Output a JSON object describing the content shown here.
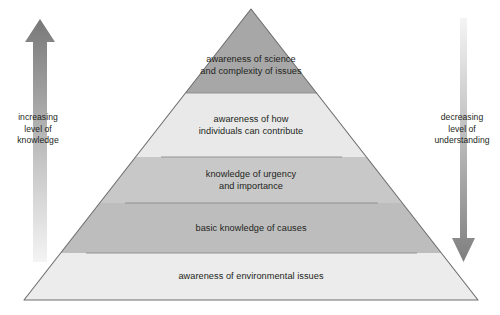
{
  "diagram": {
    "type": "pyramid",
    "title": "",
    "levels": [
      {
        "id": "level-5-top",
        "label": "awareness of science\nand complexity of issues",
        "fill": "#a7a7a7",
        "rank": 5
      },
      {
        "id": "level-4",
        "label": "awareness of how\nindividuals can contribute",
        "fill": "#e9e9e9",
        "rank": 4
      },
      {
        "id": "level-3",
        "label": "knowledge of urgency\nand importance",
        "fill": "#c8c8c8",
        "rank": 3
      },
      {
        "id": "level-2",
        "label": "basic knowledge of causes",
        "fill": "#bdbdbd",
        "rank": 2
      },
      {
        "id": "level-1-base",
        "label": "awareness of environmental issues",
        "fill": "#ececec",
        "rank": 1
      }
    ],
    "outline_color": "#6e6e6e",
    "divider_color": "#8c8c8c"
  },
  "left_axis": {
    "name": "increasing-level-of-knowledge",
    "label": "increasing\nlevel of\nknowledge",
    "direction": "up",
    "arrow_color_dark": "#7d7d7d",
    "arrow_color_light": "#f2f2f2"
  },
  "right_axis": {
    "name": "decreasing-level-of-understanding",
    "label": "decreasing\nlevel of\nunderstanding",
    "direction": "down",
    "arrow_color_dark": "#8a8a8a",
    "arrow_color_light": "#f2f2f2"
  }
}
